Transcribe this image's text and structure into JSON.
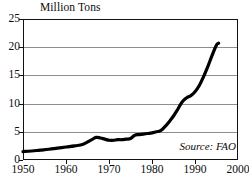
{
  "chart_data": {
    "type": "line",
    "title": "Million Tons",
    "subtitle": "",
    "xlabel": "",
    "ylabel": "Million Tons",
    "xlim": [
      1950,
      2000
    ],
    "ylim": [
      0,
      25
    ],
    "xticks": [
      1950,
      1960,
      1970,
      1980,
      1990,
      2000
    ],
    "yticks": [
      0,
      5,
      10,
      15,
      20,
      25
    ],
    "xtick_labels": [
      "1950",
      "1960",
      "1970",
      "1980",
      "1990",
      "2000"
    ],
    "ytick_labels": [
      "0",
      "5",
      "10",
      "15",
      "20",
      "25"
    ],
    "grid": "horizontal",
    "gridlines_at": [
      5,
      10,
      15,
      20
    ],
    "legend": null,
    "legend_position": "none",
    "annotations": [
      {
        "text": "Source: FAO",
        "style": "italic",
        "position": "bottom-right"
      }
    ],
    "series": [
      {
        "name": "Aquaculture production",
        "color": "#000000",
        "line_width_px": 3.2,
        "x": [
          1950,
          1952,
          1954,
          1956,
          1958,
          1960,
          1962,
          1964,
          1966,
          1967,
          1968,
          1969,
          1970,
          1971,
          1972,
          1973,
          1974,
          1975,
          1976,
          1977,
          1978,
          1979,
          1980,
          1981,
          1982,
          1983,
          1984,
          1985,
          1986,
          1987,
          1988,
          1989,
          1990,
          1991,
          1992,
          1993,
          1994,
          1995,
          1995.5
        ],
        "y": [
          1.5,
          1.6,
          1.75,
          1.9,
          2.1,
          2.3,
          2.5,
          2.8,
          3.6,
          4.0,
          3.9,
          3.7,
          3.5,
          3.5,
          3.6,
          3.6,
          3.7,
          3.8,
          4.4,
          4.5,
          4.6,
          4.7,
          4.8,
          5.0,
          5.2,
          5.9,
          6.8,
          7.8,
          9.0,
          10.3,
          11.0,
          11.4,
          12.1,
          13.2,
          14.8,
          16.6,
          18.6,
          20.4,
          20.7
        ]
      }
    ]
  },
  "source_note": "Source: FAO",
  "axis_title": "Million Tons"
}
